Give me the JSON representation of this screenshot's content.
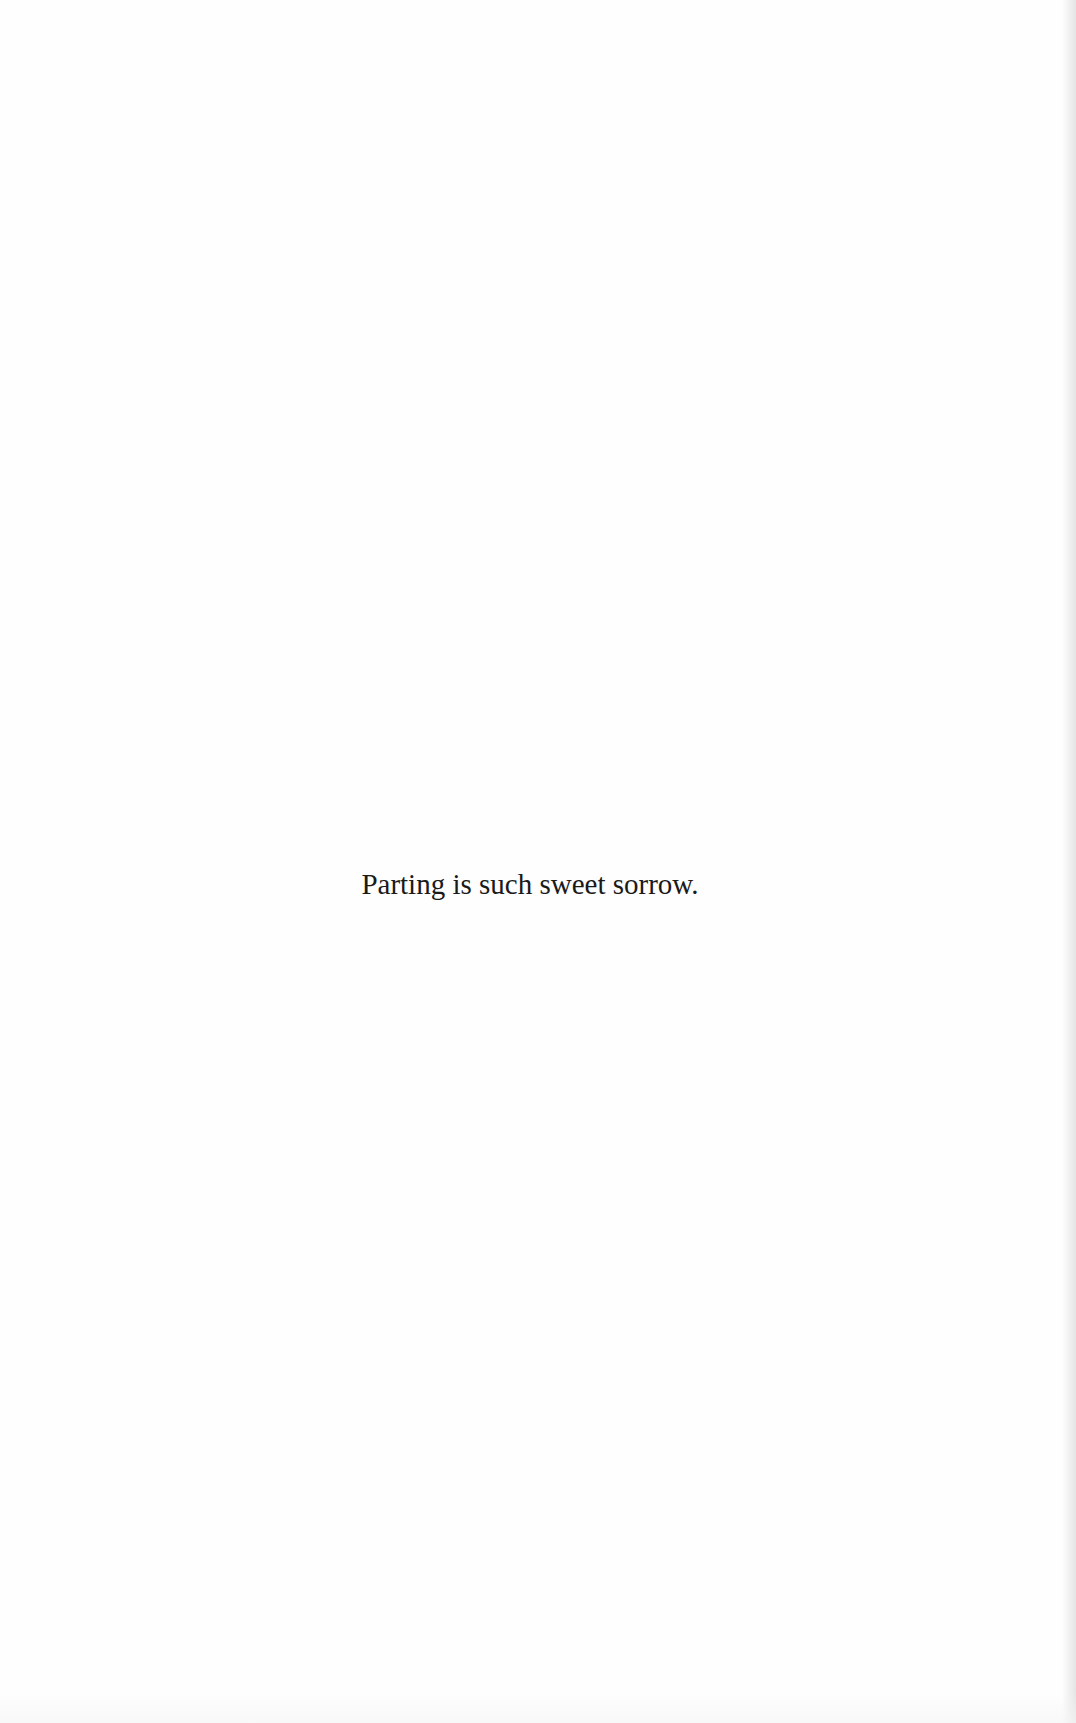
{
  "page": {
    "epigraph": "Parting is such sweet sorrow."
  }
}
